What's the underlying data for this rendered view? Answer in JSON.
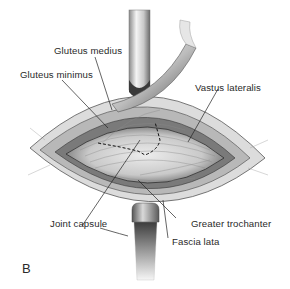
{
  "figure": {
    "panel_letter": "B",
    "labels": {
      "gluteus_medius": "Gluteus medius",
      "gluteus_minimus": "Gluteus minimus",
      "vastus_lateralis": "Vastus lateralis",
      "joint_capsule": "Joint capsule",
      "greater_trochanter": "Greater trochanter",
      "fascia_lata": "Fascia lata"
    },
    "colors": {
      "background": "#ffffff",
      "text": "#2a2a2a",
      "leader_line": "#222222",
      "tissue_dark": "#3a3a3a",
      "tissue_mid": "#9a9a9a",
      "tissue_light": "#e2e2e2",
      "retractor_light": "#f2f2f2",
      "retractor_dark": "#4a4a4a"
    }
  }
}
